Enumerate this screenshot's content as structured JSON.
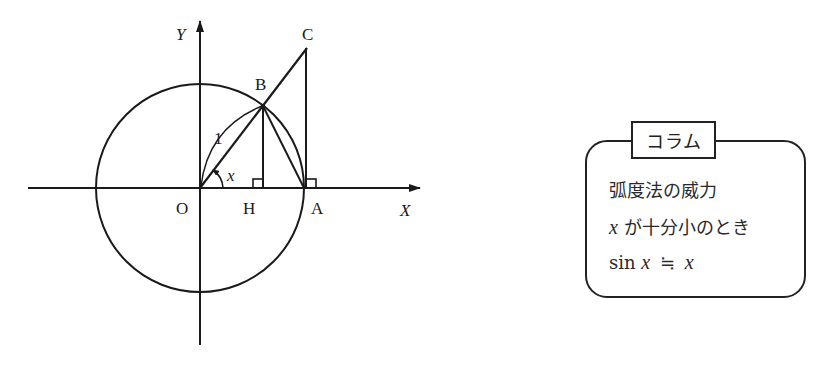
{
  "figure": {
    "axis_labels": {
      "x": "X",
      "y": "Y"
    },
    "points": {
      "O": "O",
      "H": "H",
      "A": "A",
      "B": "B",
      "C": "C"
    },
    "radius_label": "1",
    "angle_label": "x",
    "geometry": {
      "origin": [
        200,
        188
      ],
      "radius": 104,
      "B": [
        263,
        106
      ],
      "C": [
        307,
        48
      ],
      "H": [
        263,
        188
      ],
      "A": [
        304,
        188
      ]
    }
  },
  "column": {
    "title": "コラム",
    "lines": [
      "弧度法の威力",
      "が十分小のとき",
      "sin"
    ],
    "math": {
      "x_var": "x",
      "approx": "≒",
      "x_var2": "x"
    }
  }
}
